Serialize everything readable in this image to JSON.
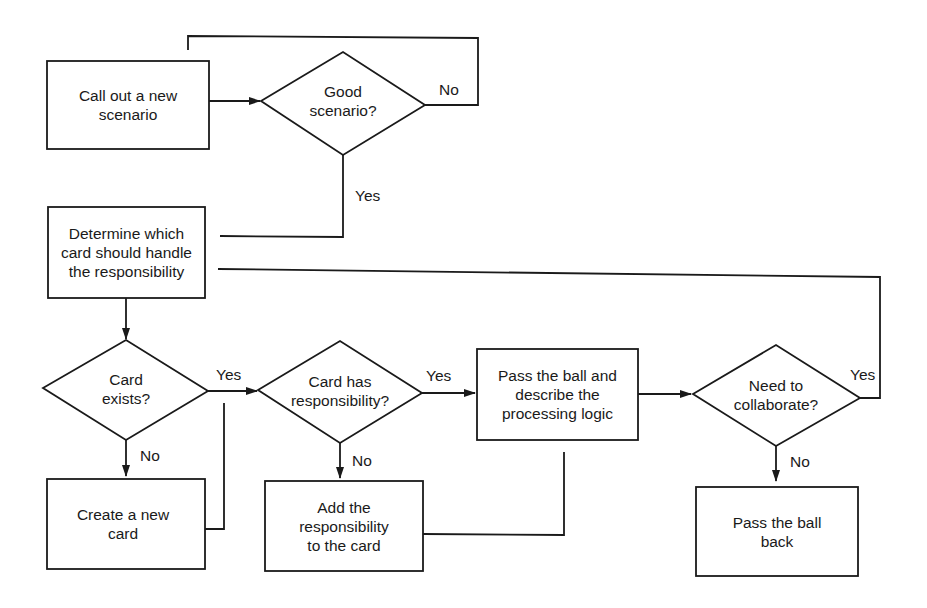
{
  "diagram": {
    "type": "flowchart",
    "nodes": {
      "call_out": {
        "shape": "process",
        "label": "Call out a new\nscenario"
      },
      "good_scenario": {
        "shape": "decision",
        "label": "Good\nscenario?"
      },
      "determine_card": {
        "shape": "process",
        "label": "Determine which\ncard should handle\nthe responsibility"
      },
      "card_exists": {
        "shape": "decision",
        "label": "Card\nexists?"
      },
      "create_card": {
        "shape": "process",
        "label": "Create a new\ncard"
      },
      "card_has_resp": {
        "shape": "decision",
        "label": "Card has\nresponsibility?"
      },
      "add_resp": {
        "shape": "process",
        "label": "Add the\nresponsibility\nto the card"
      },
      "pass_ball_describe": {
        "shape": "process",
        "label": "Pass the ball and\ndescribe the\nprocessing logic"
      },
      "need_collab": {
        "shape": "decision",
        "label": "Need to\ncollaborate?"
      },
      "pass_ball_back": {
        "shape": "process",
        "label": "Pass the ball\nback"
      }
    },
    "edge_labels": {
      "good_no": "No",
      "good_yes": "Yes",
      "exists_yes": "Yes",
      "exists_no": "No",
      "has_resp_yes": "Yes",
      "has_resp_no": "No",
      "collab_yes": "Yes",
      "collab_no": "No"
    },
    "edges": [
      {
        "from": "call_out",
        "to": "good_scenario",
        "label": ""
      },
      {
        "from": "good_scenario",
        "to": "call_out",
        "label": "No"
      },
      {
        "from": "good_scenario",
        "to": "determine_card",
        "label": "Yes"
      },
      {
        "from": "determine_card",
        "to": "card_exists",
        "label": ""
      },
      {
        "from": "card_exists",
        "to": "card_has_resp",
        "label": "Yes"
      },
      {
        "from": "card_exists",
        "to": "create_card",
        "label": "No"
      },
      {
        "from": "create_card",
        "to": "card_has_resp",
        "label": ""
      },
      {
        "from": "card_has_resp",
        "to": "pass_ball_describe",
        "label": "Yes"
      },
      {
        "from": "card_has_resp",
        "to": "add_resp",
        "label": "No"
      },
      {
        "from": "add_resp",
        "to": "pass_ball_describe",
        "label": ""
      },
      {
        "from": "pass_ball_describe",
        "to": "need_collab",
        "label": ""
      },
      {
        "from": "need_collab",
        "to": "determine_card",
        "label": "Yes"
      },
      {
        "from": "need_collab",
        "to": "pass_ball_back",
        "label": "No"
      }
    ],
    "colors": {
      "stroke": "#1a1a1a",
      "background": "#ffffff"
    }
  }
}
